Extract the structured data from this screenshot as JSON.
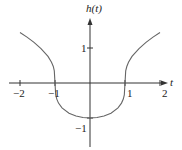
{
  "chart_data": {
    "type": "line",
    "title": "",
    "function_label": "h(t)",
    "xlabel": "t",
    "ylabel": "h(t)",
    "xlim": [
      -2.1,
      2.2
    ],
    "ylim": [
      -1.8,
      2.3
    ],
    "grid": false,
    "x_ticks": [
      -2,
      -1,
      1,
      2
    ],
    "x_tick_labels": [
      "−2",
      "−1",
      "1",
      "2"
    ],
    "y_ticks": [
      1,
      -1
    ],
    "y_tick_labels": [
      "1",
      "−1"
    ],
    "series": [
      {
        "name": "h(t)",
        "x": [
          -2,
          -1.8,
          -1.6,
          -1.4,
          -1.2,
          -1.1,
          -1.05,
          -1.02,
          -1,
          -0.98,
          -0.95,
          -0.9,
          -0.8,
          -0.6,
          -0.4,
          -0.2,
          0,
          0.2,
          0.4,
          0.6,
          0.8,
          0.9,
          0.95,
          0.98,
          1,
          1.02,
          1.05,
          1.1,
          1.2,
          1.4,
          1.6,
          1.8,
          2
        ],
        "y": [
          1.442,
          1.31,
          1.16,
          0.983,
          0.76,
          0.594,
          0.472,
          0.345,
          0,
          -0.342,
          -0.461,
          -0.575,
          -0.711,
          -0.862,
          -0.944,
          -0.987,
          -1,
          -0.987,
          -0.944,
          -0.862,
          -0.711,
          -0.575,
          -0.461,
          -0.342,
          0,
          0.345,
          0.472,
          0.594,
          0.76,
          0.983,
          1.16,
          1.31,
          1.442
        ]
      }
    ]
  },
  "axes": {
    "x_label": "t",
    "y_label": "h(t)",
    "origin_px": [
      90,
      83
    ],
    "unit_px": 35
  },
  "colors": {
    "axis": "#333333",
    "curve": "#666666"
  }
}
